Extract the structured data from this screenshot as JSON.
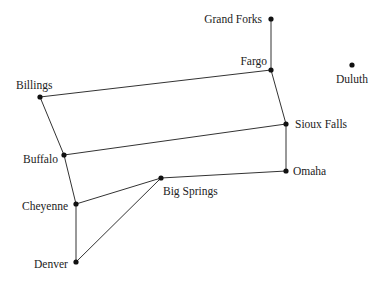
{
  "diagram": {
    "type": "graph",
    "nodes": [
      {
        "id": "grand_forks",
        "label": "Grand Forks",
        "x": 271,
        "y": 19,
        "lx": 262,
        "ly": 23,
        "anchor": "end"
      },
      {
        "id": "fargo",
        "label": "Fargo",
        "x": 271,
        "y": 70,
        "lx": 267,
        "ly": 65,
        "anchor": "end"
      },
      {
        "id": "duluth",
        "label": "Duluth",
        "x": 352,
        "y": 65,
        "lx": 352,
        "ly": 83,
        "anchor": "middle"
      },
      {
        "id": "billings",
        "label": "Billings",
        "x": 40,
        "y": 97,
        "lx": 16,
        "ly": 89,
        "anchor": "start"
      },
      {
        "id": "sioux_falls",
        "label": "Sioux Falls",
        "x": 286,
        "y": 124,
        "lx": 295,
        "ly": 128,
        "anchor": "start"
      },
      {
        "id": "buffalo",
        "label": "Buffalo",
        "x": 64,
        "y": 155,
        "lx": 23,
        "ly": 163,
        "anchor": "start"
      },
      {
        "id": "omaha",
        "label": "Omaha",
        "x": 286,
        "y": 171,
        "lx": 293,
        "ly": 175,
        "anchor": "start"
      },
      {
        "id": "big_springs",
        "label": "Big Springs",
        "x": 161,
        "y": 178,
        "lx": 163,
        "ly": 195,
        "anchor": "start"
      },
      {
        "id": "cheyenne",
        "label": "Cheyenne",
        "x": 76,
        "y": 204,
        "lx": 22,
        "ly": 210,
        "anchor": "start"
      },
      {
        "id": "denver",
        "label": "Denver",
        "x": 76,
        "y": 262,
        "lx": 34,
        "ly": 268,
        "anchor": "start"
      }
    ],
    "edges": [
      [
        "grand_forks",
        "fargo"
      ],
      [
        "fargo",
        "billings"
      ],
      [
        "fargo",
        "sioux_falls"
      ],
      [
        "billings",
        "buffalo"
      ],
      [
        "sioux_falls",
        "buffalo"
      ],
      [
        "sioux_falls",
        "omaha"
      ],
      [
        "buffalo",
        "cheyenne"
      ],
      [
        "omaha",
        "big_springs"
      ],
      [
        "big_springs",
        "cheyenne"
      ],
      [
        "big_springs",
        "denver"
      ],
      [
        "cheyenne",
        "denver"
      ]
    ]
  }
}
